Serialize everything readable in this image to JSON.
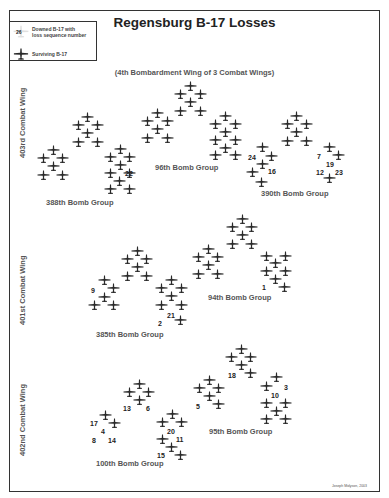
{
  "title": "Regensburg B-17 Losses",
  "subtitle": "(4th Bombardment Wing of 3 Combat Wings)",
  "legend": {
    "downed_label_line1": "Downed B-17 with",
    "downed_label_line2": "loss sequence number",
    "downed_sample_number": "26",
    "surviving_label": "Surviving B-17"
  },
  "colors": {
    "plane": "#2a2a2a",
    "text": "#555555",
    "border": "#333333",
    "downed_halo": "#d0d0d0"
  },
  "credit": "Joseph Molyson, 2003",
  "wings": [
    {
      "name": "403rd Combat Wing",
      "x": 18,
      "y": 158
    },
    {
      "name": "401st Combat Wing",
      "x": 18,
      "y": 325
    },
    {
      "name": "402nd Combat Wing",
      "x": 18,
      "y": 456
    }
  ],
  "groups": [
    {
      "name": "388th Bomb Group",
      "wing": "403rd Combat Wing",
      "label_x": 46,
      "label_y": 198,
      "planes": [
        [
          53,
          150
        ],
        [
          43,
          158
        ],
        [
          62,
          158
        ],
        [
          53,
          166
        ],
        [
          43,
          175
        ],
        [
          62,
          175
        ],
        [
          87,
          117
        ],
        [
          78,
          125
        ],
        [
          97,
          125
        ],
        [
          87,
          133
        ],
        [
          78,
          142
        ],
        [
          97,
          142
        ],
        [
          120,
          149
        ],
        [
          110,
          157
        ],
        [
          129,
          157
        ],
        [
          120,
          165
        ],
        [
          110,
          173
        ],
        [
          129,
          173
        ],
        [
          119,
          181
        ],
        [
          110,
          189
        ],
        [
          129,
          189
        ]
      ],
      "lost": [
        {
          "n": "22",
          "x": 125,
          "y": 170
        }
      ]
    },
    {
      "name": "96th Bomb Group",
      "wing": "403rd Combat Wing",
      "label_x": 155,
      "label_y": 163,
      "planes": [
        [
          190,
          86
        ],
        [
          180,
          94
        ],
        [
          200,
          94
        ],
        [
          190,
          102
        ],
        [
          180,
          111
        ],
        [
          200,
          111
        ],
        [
          157,
          113
        ],
        [
          147,
          121
        ],
        [
          167,
          121
        ],
        [
          157,
          129
        ],
        [
          147,
          138
        ],
        [
          167,
          138
        ],
        [
          225,
          116
        ],
        [
          215,
          124
        ],
        [
          235,
          124
        ],
        [
          225,
          132
        ],
        [
          215,
          140
        ],
        [
          235,
          140
        ],
        [
          225,
          148
        ],
        [
          215,
          155
        ],
        [
          235,
          155
        ]
      ],
      "lost": [
        {
          "n": "24",
          "x": 248,
          "y": 154
        }
      ]
    },
    {
      "name": "390th Bomb Group",
      "wing": "403rd Combat Wing",
      "label_x": 261,
      "label_y": 189,
      "planes": [
        [
          296,
          116
        ],
        [
          287,
          124
        ],
        [
          306,
          124
        ],
        [
          296,
          132
        ],
        [
          287,
          141
        ],
        [
          306,
          141
        ],
        [
          262,
          147
        ],
        [
          271,
          156
        ],
        [
          262,
          164
        ],
        [
          252,
          172
        ],
        [
          261,
          182
        ],
        [
          329,
          147
        ],
        [
          338,
          155
        ],
        [
          329,
          178
        ]
      ],
      "lost": [
        {
          "n": "16",
          "x": 268,
          "y": 168
        },
        {
          "n": "7",
          "x": 317,
          "y": 153
        },
        {
          "n": "19",
          "x": 326,
          "y": 161
        },
        {
          "n": "12",
          "x": 316,
          "y": 169
        },
        {
          "n": "23",
          "x": 335,
          "y": 169
        }
      ]
    },
    {
      "name": "385th Bomb Group",
      "wing": "401st Combat Wing",
      "label_x": 96,
      "label_y": 330,
      "planes": [
        [
          137,
          251
        ],
        [
          127,
          259
        ],
        [
          146,
          259
        ],
        [
          137,
          267
        ],
        [
          127,
          276
        ],
        [
          146,
          276
        ],
        [
          104,
          280
        ],
        [
          113,
          288
        ],
        [
          104,
          297
        ],
        [
          94,
          305
        ],
        [
          113,
          305
        ],
        [
          171,
          280
        ],
        [
          161,
          288
        ],
        [
          181,
          288
        ],
        [
          171,
          296
        ],
        [
          161,
          305
        ],
        [
          181,
          305
        ],
        [
          180,
          320
        ]
      ],
      "lost": [
        {
          "n": "9",
          "x": 91,
          "y": 287
        },
        {
          "n": "21",
          "x": 167,
          "y": 312
        },
        {
          "n": "2",
          "x": 158,
          "y": 320
        }
      ]
    },
    {
      "name": "94th Bomb Group",
      "wing": "401st Combat Wing",
      "label_x": 208,
      "label_y": 293,
      "planes": [
        [
          242,
          219
        ],
        [
          232,
          227
        ],
        [
          251,
          227
        ],
        [
          242,
          235
        ],
        [
          232,
          244
        ],
        [
          251,
          244
        ],
        [
          208,
          249
        ],
        [
          198,
          257
        ],
        [
          217,
          257
        ],
        [
          208,
          265
        ],
        [
          198,
          274
        ],
        [
          217,
          274
        ],
        [
          266,
          256
        ],
        [
          285,
          256
        ],
        [
          275,
          263
        ],
        [
          266,
          271
        ],
        [
          285,
          271
        ],
        [
          275,
          279
        ],
        [
          284,
          287
        ]
      ],
      "lost": [
        {
          "n": "1",
          "x": 262,
          "y": 284
        }
      ]
    },
    {
      "name": "100th Bomb Group",
      "wing": "402nd Combat Wing",
      "label_x": 96,
      "label_y": 459,
      "planes": [
        [
          139,
          384
        ],
        [
          129,
          392
        ],
        [
          148,
          392
        ],
        [
          139,
          400
        ],
        [
          105,
          415
        ],
        [
          114,
          423
        ],
        [
          172,
          414
        ],
        [
          162,
          422
        ],
        [
          181,
          422
        ],
        [
          162,
          439
        ],
        [
          171,
          447
        ],
        [
          180,
          455
        ]
      ],
      "lost": [
        {
          "n": "13",
          "x": 123,
          "y": 405
        },
        {
          "n": "6",
          "x": 146,
          "y": 405
        },
        {
          "n": "17",
          "x": 90,
          "y": 420
        },
        {
          "n": "4",
          "x": 101,
          "y": 428
        },
        {
          "n": "8",
          "x": 92,
          "y": 437
        },
        {
          "n": "14",
          "x": 108,
          "y": 437
        },
        {
          "n": "20",
          "x": 167,
          "y": 428
        },
        {
          "n": "11",
          "x": 176,
          "y": 436
        },
        {
          "n": "15",
          "x": 157,
          "y": 452
        }
      ]
    },
    {
      "name": "95th Bomb Group",
      "wing": "402nd Combat Wing",
      "label_x": 209,
      "label_y": 427,
      "planes": [
        [
          241,
          349
        ],
        [
          231,
          357
        ],
        [
          250,
          357
        ],
        [
          241,
          365
        ],
        [
          250,
          373
        ],
        [
          209,
          380
        ],
        [
          199,
          388
        ],
        [
          218,
          388
        ],
        [
          209,
          396
        ],
        [
          218,
          404
        ],
        [
          276,
          377
        ],
        [
          266,
          386
        ],
        [
          266,
          403
        ],
        [
          285,
          403
        ],
        [
          276,
          411
        ],
        [
          266,
          419
        ],
        [
          285,
          419
        ]
      ],
      "lost": [
        {
          "n": "18",
          "x": 228,
          "y": 372
        },
        {
          "n": "5",
          "x": 196,
          "y": 403
        },
        {
          "n": "3",
          "x": 284,
          "y": 384
        },
        {
          "n": "10",
          "x": 271,
          "y": 392
        }
      ]
    }
  ]
}
